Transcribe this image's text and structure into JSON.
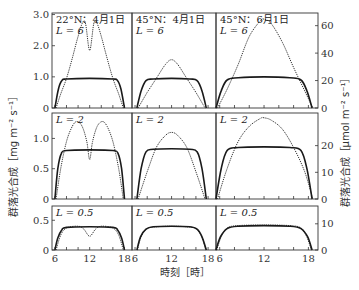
{
  "chart_data": {
    "type": "line",
    "title": "",
    "xlabel": "時刻［時］",
    "ylabel_left": "群落光合成［mg m⁻² s⁻¹］",
    "ylabel_right": "群落光合成［µmol m⁻² s⁻¹］",
    "columns": [
      "22°N：4月1日",
      "45°N：4月1日",
      "45°N：6月1日"
    ],
    "rows": [
      "L = 6",
      "L = 2",
      "L = 0.5"
    ],
    "x_ticks": [
      6,
      12,
      18
    ],
    "x_range": [
      5.5,
      19.3
    ],
    "legend": {
      "solid": "sun-limited / light-saturated model",
      "dotted": "alternate model"
    },
    "panels": [
      {
        "row": 0,
        "col": 0,
        "label_top": "22°N：4月1日",
        "label_L": "L = 6",
        "solid": [
          [
            6,
            0
          ],
          [
            6.6,
            0.6
          ],
          [
            7.2,
            0.88
          ],
          [
            8,
            0.93
          ],
          [
            12,
            0.95
          ],
          [
            16,
            0.93
          ],
          [
            16.8,
            0.88
          ],
          [
            17.4,
            0.6
          ],
          [
            18,
            0
          ]
        ],
        "dotted": [
          [
            6.2,
            0
          ],
          [
            7,
            0.45
          ],
          [
            8,
            0.95
          ],
          [
            9,
            1.6
          ],
          [
            10,
            2.3
          ],
          [
            10.8,
            2.75
          ],
          [
            11.3,
            2.7
          ],
          [
            12,
            1.85
          ],
          [
            12.7,
            2.7
          ],
          [
            13.2,
            2.75
          ],
          [
            14,
            2.3
          ],
          [
            15,
            1.6
          ],
          [
            16,
            0.95
          ],
          [
            17,
            0.45
          ],
          [
            17.8,
            0
          ]
        ]
      },
      {
        "row": 0,
        "col": 1,
        "label_top": "45°N：4月1日",
        "label_L": "L = 6",
        "solid": [
          [
            6.3,
            0
          ],
          [
            7,
            0.55
          ],
          [
            7.8,
            0.88
          ],
          [
            9,
            0.93
          ],
          [
            12,
            0.95
          ],
          [
            15,
            0.93
          ],
          [
            16.2,
            0.88
          ],
          [
            17,
            0.55
          ],
          [
            17.7,
            0
          ]
        ],
        "dotted": [
          [
            6.5,
            0
          ],
          [
            8,
            0.5
          ],
          [
            9.5,
            0.95
          ],
          [
            11,
            1.4
          ],
          [
            12,
            1.55
          ],
          [
            13,
            1.4
          ],
          [
            14.5,
            0.95
          ],
          [
            16,
            0.5
          ],
          [
            17.5,
            0
          ]
        ]
      },
      {
        "row": 0,
        "col": 2,
        "label_top": "45°N：6月1日",
        "label_L": "L = 6",
        "solid": [
          [
            5.5,
            0
          ],
          [
            6.2,
            0.55
          ],
          [
            7,
            0.9
          ],
          [
            8.5,
            0.97
          ],
          [
            12,
            1.0
          ],
          [
            15.5,
            0.97
          ],
          [
            17,
            0.9
          ],
          [
            17.8,
            0.55
          ],
          [
            18.5,
            0
          ]
        ],
        "dotted": [
          [
            5.7,
            0
          ],
          [
            7,
            0.6
          ],
          [
            8.5,
            1.4
          ],
          [
            10,
            2.3
          ],
          [
            11.5,
            2.8
          ],
          [
            12,
            2.85
          ],
          [
            13,
            2.7
          ],
          [
            14.5,
            2.1
          ],
          [
            16,
            1.3
          ],
          [
            17.5,
            0.55
          ],
          [
            18.6,
            0
          ]
        ]
      },
      {
        "row": 1,
        "col": 0,
        "label_L": "L = 2",
        "solid": [
          [
            6,
            0
          ],
          [
            6.5,
            0.5
          ],
          [
            7.1,
            0.75
          ],
          [
            8,
            0.8
          ],
          [
            12,
            0.81
          ],
          [
            16,
            0.8
          ],
          [
            16.9,
            0.75
          ],
          [
            17.5,
            0.5
          ],
          [
            18,
            0
          ]
        ],
        "dotted": [
          [
            6.2,
            0
          ],
          [
            7,
            0.5
          ],
          [
            8,
            0.95
          ],
          [
            9,
            1.2
          ],
          [
            9.8,
            1.28
          ],
          [
            10.7,
            1.2
          ],
          [
            11.5,
            0.95
          ],
          [
            12,
            0.65
          ],
          [
            12.5,
            0.95
          ],
          [
            13.3,
            1.2
          ],
          [
            14.2,
            1.28
          ],
          [
            15,
            1.2
          ],
          [
            16,
            0.95
          ],
          [
            17,
            0.5
          ],
          [
            17.8,
            0
          ]
        ]
      },
      {
        "row": 1,
        "col": 1,
        "label_L": "L = 2",
        "solid": [
          [
            6.3,
            0
          ],
          [
            7,
            0.5
          ],
          [
            7.8,
            0.78
          ],
          [
            9,
            0.82
          ],
          [
            12,
            0.83
          ],
          [
            15,
            0.82
          ],
          [
            16.2,
            0.78
          ],
          [
            17,
            0.5
          ],
          [
            17.7,
            0
          ]
        ],
        "dotted": [
          [
            6.5,
            0
          ],
          [
            8,
            0.45
          ],
          [
            9.5,
            0.85
          ],
          [
            11,
            1.05
          ],
          [
            12,
            1.1
          ],
          [
            13,
            1.05
          ],
          [
            14.5,
            0.85
          ],
          [
            16,
            0.45
          ],
          [
            17.5,
            0
          ]
        ]
      },
      {
        "row": 1,
        "col": 2,
        "label_L": "L = 2",
        "solid": [
          [
            5.5,
            0
          ],
          [
            6.2,
            0.5
          ],
          [
            7,
            0.8
          ],
          [
            8.5,
            0.85
          ],
          [
            12,
            0.86
          ],
          [
            15.5,
            0.85
          ],
          [
            17,
            0.8
          ],
          [
            17.8,
            0.5
          ],
          [
            18.5,
            0
          ]
        ],
        "dotted": [
          [
            5.7,
            0
          ],
          [
            7,
            0.5
          ],
          [
            8.5,
            0.95
          ],
          [
            10,
            1.2
          ],
          [
            11.5,
            1.33
          ],
          [
            12,
            1.34
          ],
          [
            13,
            1.3
          ],
          [
            14.5,
            1.15
          ],
          [
            16,
            0.85
          ],
          [
            17.5,
            0.45
          ],
          [
            18.6,
            0
          ]
        ]
      },
      {
        "row": 2,
        "col": 0,
        "label_L": "L = 0.5",
        "solid": [
          [
            6,
            0
          ],
          [
            6.5,
            0.2
          ],
          [
            7.2,
            0.34
          ],
          [
            8,
            0.38
          ],
          [
            12,
            0.39
          ],
          [
            16,
            0.38
          ],
          [
            16.8,
            0.34
          ],
          [
            17.5,
            0.2
          ],
          [
            18,
            0
          ]
        ],
        "dotted": [
          [
            6.2,
            0
          ],
          [
            7,
            0.25
          ],
          [
            8,
            0.37
          ],
          [
            10,
            0.4
          ],
          [
            11,
            0.35
          ],
          [
            12,
            0.23
          ],
          [
            13,
            0.35
          ],
          [
            14,
            0.4
          ],
          [
            16,
            0.37
          ],
          [
            17,
            0.25
          ],
          [
            17.8,
            0
          ]
        ]
      },
      {
        "row": 2,
        "col": 1,
        "label_L": "L = 0.5",
        "solid": [
          [
            6.3,
            0
          ],
          [
            6.9,
            0.22
          ],
          [
            7.8,
            0.35
          ],
          [
            9,
            0.39
          ],
          [
            12,
            0.4
          ],
          [
            15,
            0.39
          ],
          [
            16.2,
            0.35
          ],
          [
            17,
            0.22
          ],
          [
            17.7,
            0
          ]
        ],
        "dotted": [
          [
            6.4,
            0
          ],
          [
            7,
            0.22
          ],
          [
            8,
            0.36
          ],
          [
            9.5,
            0.39
          ],
          [
            12,
            0.4
          ],
          [
            14.5,
            0.39
          ],
          [
            16,
            0.36
          ],
          [
            17,
            0.22
          ],
          [
            17.6,
            0
          ]
        ]
      },
      {
        "row": 2,
        "col": 2,
        "label_L": "L = 0.5",
        "solid": [
          [
            5.5,
            0
          ],
          [
            6.1,
            0.22
          ],
          [
            7,
            0.36
          ],
          [
            8.5,
            0.4
          ],
          [
            12,
            0.41
          ],
          [
            15.5,
            0.4
          ],
          [
            17,
            0.36
          ],
          [
            17.9,
            0.22
          ],
          [
            18.5,
            0
          ]
        ],
        "dotted": [
          [
            5.6,
            0
          ],
          [
            6.2,
            0.22
          ],
          [
            7,
            0.37
          ],
          [
            8.5,
            0.41
          ],
          [
            12,
            0.42
          ],
          [
            15.5,
            0.41
          ],
          [
            17,
            0.37
          ],
          [
            17.8,
            0.22
          ],
          [
            18.4,
            0
          ]
        ]
      }
    ],
    "rows_axes": [
      {
        "left_ticks": [
          0,
          1.0,
          2.0,
          3.0
        ],
        "left_tick_labels": [
          "0",
          "1.0",
          "2.0",
          "3.0"
        ],
        "ylim": [
          0,
          3.05
        ],
        "right_ticks": [
          0,
          20,
          40,
          60
        ],
        "right_tick_labels": [
          "0",
          "20",
          "40",
          "60"
        ]
      },
      {
        "left_ticks": [
          0,
          0.5,
          1.0
        ],
        "left_tick_labels": [
          "0",
          "0.5",
          "1.0"
        ],
        "ylim": [
          0,
          1.42
        ],
        "right_ticks": [
          0,
          10,
          20
        ],
        "right_tick_labels": [
          "0",
          "10",
          "20"
        ]
      },
      {
        "left_ticks": [
          0,
          0.5
        ],
        "left_tick_labels": [
          "0",
          "0.5"
        ],
        "ylim": [
          0,
          0.74
        ],
        "right_ticks": [
          0,
          10
        ],
        "right_tick_labels": [
          "0",
          "10"
        ]
      }
    ],
    "right_axis_scale": 22.7,
    "grid": false
  }
}
